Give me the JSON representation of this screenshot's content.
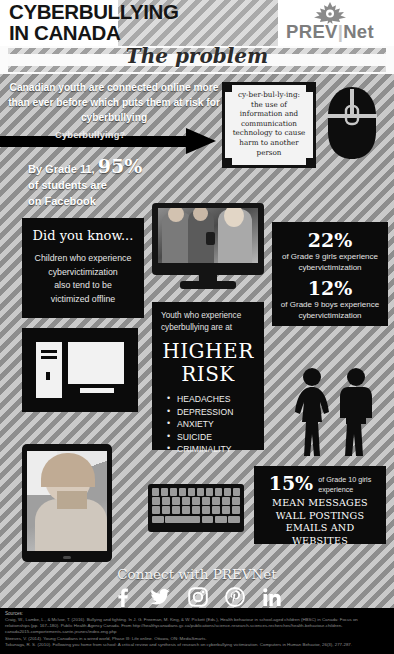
{
  "header": {
    "title_line1": "CYBERBULLYING",
    "title_line2": "IN CANADA",
    "logo_prev": "PREV",
    "logo_v": "",
    "logo_net": "Net",
    "logo_icon": "maple-leaf-icon"
  },
  "band": {
    "title": "The problem"
  },
  "intro": {
    "text": "Canadian youth are connected online more than ever before which puts them at risk for cyberbullying",
    "arrow_label": "Cyberbullying?",
    "stat_prefix": "By Grade 11,",
    "stat_number": "95%",
    "stat_line2": "of students are",
    "stat_line3": "on Facebook"
  },
  "definition": {
    "term": "cy-ber-bul-ly-ing:",
    "body": "the use of information and communication technology to cause harm to another person",
    "icon": "computer-mouse-icon"
  },
  "did_you_know": {
    "heading": "Did you know...",
    "line1": "Children who experience",
    "line2": "cybervictimization",
    "line3": "also tend to be",
    "line4": "victimized offline"
  },
  "monitor": {
    "icon": "desktop-monitor-photo"
  },
  "computer_icon": {
    "icon": "desktop-computer-icon"
  },
  "stats": [
    {
      "number": "22%",
      "text": "of Grade 9 girls experience cybervictimization"
    },
    {
      "number": "12%",
      "text": "of Grade 9 boys experience cybervictimization"
    }
  ],
  "risk": {
    "intro_line1": "Youth who experience",
    "intro_line2": "cyberbullying are at",
    "big_line1": "HIGHER",
    "big_line2": "RISK",
    "items": [
      "HEADACHES",
      "DEPRESSION",
      "ANXIETY",
      "SUICIDE",
      "CRIMINALITY"
    ]
  },
  "people": {
    "icon": "female-male-silhouette-icon"
  },
  "tablet": {
    "icon": "tablet-sad-girl-photo"
  },
  "keyboard": {
    "icon": "keyboard-icon"
  },
  "box15": {
    "number": "15%",
    "subtext_line1": "of Grade 10 girls",
    "subtext_line2": "experience",
    "list_line1": "MEAN MESSAGES",
    "list_line2": "WALL POSTINGS",
    "list_line3": "EMAILS AND WEBSITES"
  },
  "footer": {
    "connect": "Connect with PREVNet",
    "social": [
      {
        "name": "facebook-icon",
        "label": "Facebook"
      },
      {
        "name": "twitter-icon",
        "label": "Twitter"
      },
      {
        "name": "instagram-icon",
        "label": "Instagram"
      },
      {
        "name": "pinterest-icon",
        "label": "Pinterest"
      },
      {
        "name": "linkedin-icon",
        "label": "LinkedIn"
      }
    ],
    "sources_heading": "Sources:",
    "sources": [
      "Craig, W., Lambe, L., & McIvor, T. (2016). Bullying and fighting. In J. G. Freeman, M. King, & W. Pickett (Eds.), Health behaviour in school-aged children (HBSC) in Canada: Focus on",
      "relationships (pp. 167–180). Public Health Agency Canada. From http://healthycanadians.gc.ca/publications/science-research-sciences-recherches/health-behaviour-children-",
      "canada2015-comportements-sante-jeunes/index-eng.php",
      "Steeves, V. (2014). Young Canadians in a wired world, Phase III: Life online. Ottawa, ON: MediaSmarts.",
      "Tokunaga, R. S. (2010). Following you home from school: A critical review and synthesis of research on cyberbullying victimization. Computers in Human Behavior, 26(3), 277-287."
    ]
  },
  "colors": {
    "stripe_light": "#cacaca",
    "stripe_dark": "#8e8e8e",
    "panel_black": "#0b0b0b",
    "text_white": "#ffffff",
    "logo_gray": "#7d7d7d"
  }
}
